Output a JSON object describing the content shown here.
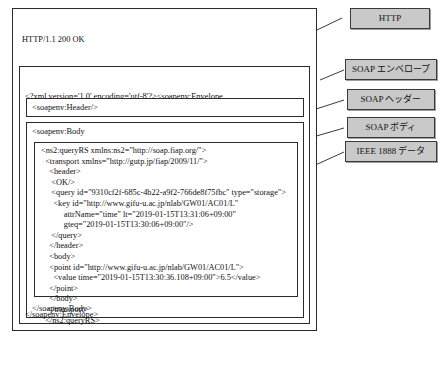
{
  "diagram": {
    "colors": {
      "callout_fill": "#c9c9c9",
      "border": "#2b2b2b",
      "background": "#ffffff",
      "text": "#111111"
    }
  },
  "http_block": {
    "status_line": "HTTP/1.1 200 OK",
    "date_header": "Date: Tue, 15 Jan 2019 04:30:12 GMT",
    "content_type_header": "Content-Type: text/xml;charset=utf-8",
    "continuation": "⋮"
  },
  "envelope_block": {
    "xml_declaration_line1": "<?xml version='1.0' encoding='utf-8'?><soapenv:Envelope",
    "xml_declaration_line2": " xmlns:soapenv=\"http://schemas.xmlsoap.org/soap/envelope/\">",
    "closing_tag": "</soapenv:Envelope>"
  },
  "soap_header_block": {
    "tag": "<soapenv:Header/>"
  },
  "soap_body_block": {
    "opening_tag": "<soapenv:Body",
    "closing_tag": "</soapenv:Body>"
  },
  "ieee1888_payload": {
    "lines": [
      "<ns2:queryRS xmlns:ns2=\"http://soap.fiap.org/\">",
      "  <transport xmlns=\"http://gutp.jp/fiap/2009/11/\">",
      "    <header>",
      "     <OK/>",
      "     <query id=\"9310cf2f-685c-4b22-a9f2-766de8f75fbc\" type=\"storage\">",
      "      <key id=\"http://www.gifu-u.ac.jp/nlab/GW01/AC01/L\"",
      "           attrName=\"time\" lt=\"2019-01-15T13:31:06+09:00\"",
      "           gteq=\"2019-01-15T13:30:06+09:00\"/>",
      "     </query>",
      "    </header>",
      "    <body>",
      "    <point id=\"http://www.gifu-u.ac.jp/nlab/GW01/AC01/L\">",
      "      <value time=\"2019-01-15T13:30:36.108+09:00\">6.5</value>",
      "    </point>",
      "    </body>",
      "   </transport>",
      "  </ns2:queryRS>"
    ]
  },
  "callouts": [
    {
      "id": "http",
      "label": "HTTP"
    },
    {
      "id": "soap-envelope",
      "label": "SOAP エンベロープ"
    },
    {
      "id": "soap-header",
      "label": "SOAP ヘッダー"
    },
    {
      "id": "soap-body",
      "label": "SOAP ボディ"
    },
    {
      "id": "ieee1888-data",
      "label": "IEEE 1888 データ"
    }
  ]
}
